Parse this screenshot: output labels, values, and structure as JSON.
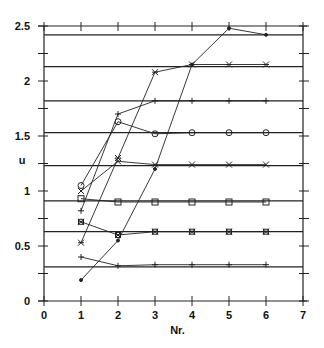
{
  "chart_data": {
    "type": "line",
    "title": "",
    "xlabel": "Nr.",
    "ylabel": "u",
    "xlim": [
      0,
      7
    ],
    "ylim": [
      0,
      2.5
    ],
    "xticks": [
      "0",
      "1",
      "2",
      "3",
      "4",
      "5",
      "6",
      "7"
    ],
    "yticks": [
      "0",
      "0.5",
      "1",
      "1.5",
      "2",
      "2.5"
    ],
    "grid": false,
    "legend": null,
    "reference_lines": [
      2.42,
      2.13,
      1.82,
      1.53,
      1.23,
      0.91,
      0.63,
      0.31
    ],
    "x": [
      1,
      2,
      3,
      4,
      5,
      6
    ],
    "series": [
      {
        "name": "dot",
        "marker": "dot",
        "values": [
          0.19,
          0.55,
          1.2,
          2.15,
          2.48,
          2.42
        ]
      },
      {
        "name": "asterisk",
        "marker": "asterisk",
        "values": [
          0.53,
          1.3,
          2.08,
          2.15,
          2.15,
          2.15
        ]
      },
      {
        "name": "plus-upper",
        "marker": "plus",
        "values": [
          0.82,
          1.7,
          1.82,
          1.82,
          1.82,
          1.82
        ]
      },
      {
        "name": "diamond",
        "marker": "diamond",
        "values": [
          1.05,
          1.63,
          1.52,
          1.53,
          1.53,
          1.53
        ]
      },
      {
        "name": "cross",
        "marker": "x",
        "values": [
          1.0,
          1.27,
          1.24,
          1.24,
          1.24,
          1.24
        ]
      },
      {
        "name": "square",
        "marker": "square",
        "values": [
          0.93,
          0.9,
          0.9,
          0.9,
          0.9,
          0.9
        ]
      },
      {
        "name": "boxed-asterisk",
        "marker": "boxed-asterisk",
        "values": [
          0.72,
          0.6,
          0.63,
          0.63,
          0.63,
          0.63
        ]
      },
      {
        "name": "plus-lower",
        "marker": "plus",
        "values": [
          0.4,
          0.32,
          0.33,
          0.33,
          0.33,
          0.33
        ]
      }
    ]
  }
}
